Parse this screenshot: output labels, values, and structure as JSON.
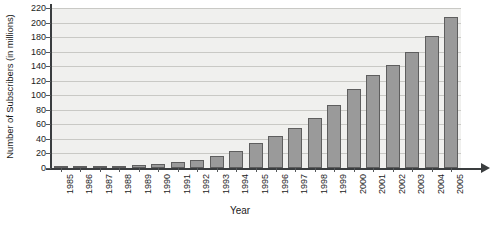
{
  "chart_data": {
    "type": "bar",
    "title": "",
    "xlabel": "Year",
    "ylabel": "Number of Subscribers (in millions)",
    "categories": [
      "1985",
      "1986",
      "1987",
      "1988",
      "1989",
      "1990",
      "1991",
      "1992",
      "1993",
      "1994",
      "1995",
      "1996",
      "1997",
      "1998",
      "1999",
      "2000",
      "2001",
      "2002",
      "2003",
      "2004",
      "2005"
    ],
    "values": [
      0.3,
      0.7,
      1.3,
      2.1,
      3.5,
      5.3,
      7.6,
      11.0,
      16.0,
      24.0,
      34.0,
      44.0,
      55.0,
      69.0,
      86.0,
      109.0,
      128.0,
      141.0,
      159.0,
      182.0,
      208.0
    ],
    "ylim": [
      0,
      220
    ],
    "ytick_step": 20,
    "yticks": [
      0,
      20,
      40,
      60,
      80,
      100,
      120,
      140,
      160,
      180,
      200,
      220
    ],
    "grid": true,
    "legend": false,
    "bar_color": "#9a9a9a",
    "bar_border_color": "#5e5e5e",
    "plot_background": "#f0f0ee",
    "gridline_color": "#c9c9c5",
    "axis_color": "#3a3d3f"
  }
}
